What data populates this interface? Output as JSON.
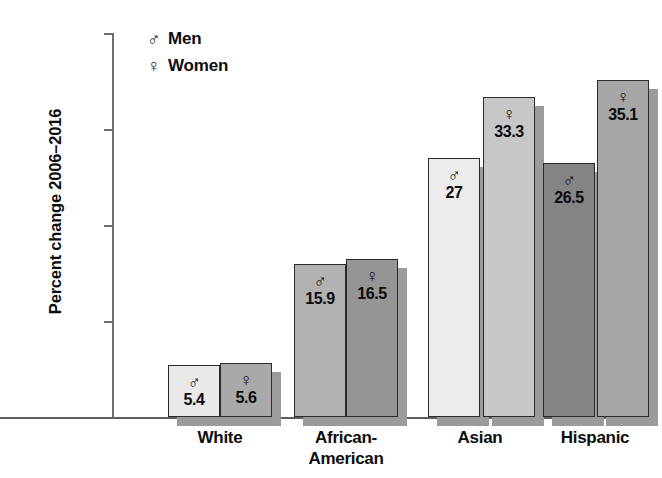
{
  "chart_data": {
    "type": "bar",
    "title": "",
    "xlabel": "",
    "ylabel": "Percent change 2006–2016",
    "ylim": [
      0,
      40
    ],
    "yticks": [
      "10%",
      "20%",
      "30%",
      "40%"
    ],
    "ytick_values": [
      10,
      20,
      30,
      40
    ],
    "grid": false,
    "legend_position": "top-left",
    "categories": [
      "White",
      "African-American",
      "Asian",
      "Hispanic"
    ],
    "category_lines": [
      [
        "White"
      ],
      [
        "African-",
        "American"
      ],
      [
        "Asian"
      ],
      [
        "Hispanic"
      ]
    ],
    "series": [
      {
        "name": "Men",
        "symbol": "♂",
        "values": [
          5.4,
          15.9,
          27,
          26.5
        ],
        "value_labels": [
          "5.4",
          "15.9",
          "27",
          "26.5"
        ],
        "colors": [
          "#e9e9e9",
          "#b2b2b2",
          "#ececec",
          "#848484"
        ]
      },
      {
        "name": "Women",
        "symbol": "♀",
        "values": [
          5.6,
          16.5,
          33.3,
          35.1
        ],
        "value_labels": [
          "5.6",
          "16.5",
          "33.3",
          "35.1"
        ],
        "colors": [
          "#a9a9a9",
          "#959595",
          "#c7c7c7",
          "#a6a6a6"
        ]
      }
    ]
  },
  "legend": {
    "items": [
      {
        "symbol": "♂",
        "label": "Men"
      },
      {
        "symbol": "♀",
        "label": "Women"
      }
    ]
  },
  "axis": {
    "y_title": "Percent change 2006–2016",
    "ticks": [
      {
        "label": "40%",
        "value": 40
      },
      {
        "label": "30%",
        "value": 30
      },
      {
        "label": "20%",
        "value": 20
      },
      {
        "label": "10%",
        "value": 10
      }
    ]
  },
  "layout": {
    "baseline_y": 417,
    "top_y": 33,
    "px_per_unit": 9.6,
    "bar_width": 52,
    "group_starts": [
      168,
      316,
      464,
      540
    ],
    "groups": [
      {
        "men_x": 168,
        "women_x": 220
      },
      {
        "men_x": 294,
        "women_x": 346
      },
      {
        "men_x": 428,
        "women_x": 483
      },
      {
        "men_x": 543,
        "women_x": 597
      }
    ]
  }
}
